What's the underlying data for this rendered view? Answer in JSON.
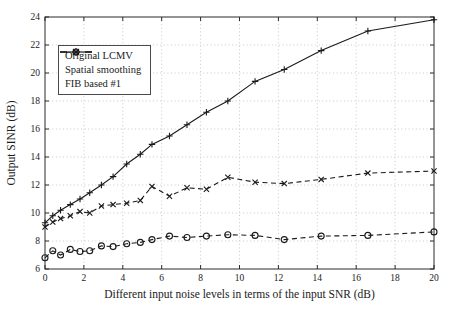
{
  "chart_data": {
    "type": "line",
    "title": "",
    "xlabel": "Different input noise levels in terms of the input SNR (dB)",
    "ylabel": "Output SINR (dB)",
    "xlim": [
      0,
      20
    ],
    "ylim": [
      6,
      24
    ],
    "xticks": [
      0,
      2,
      4,
      6,
      8,
      10,
      12,
      14,
      16,
      18,
      20
    ],
    "yticks": [
      6,
      8,
      10,
      12,
      14,
      16,
      18,
      20,
      22,
      24
    ],
    "grid": "dotted",
    "legend_position": "top-left",
    "line_color": "#1a1a1a",
    "grid_color": "#c8c8c8",
    "x": [
      0,
      0.4,
      0.8,
      1.3,
      1.8,
      2.3,
      2.9,
      3.5,
      4.2,
      4.9,
      5.5,
      6.4,
      7.3,
      8.3,
      9.4,
      10.8,
      12.3,
      14.2,
      16.6,
      20
    ],
    "series": [
      {
        "name": "Original LCMV",
        "line": "dashed",
        "marker": "circle",
        "values": [
          6.8,
          7.3,
          7.0,
          7.4,
          7.25,
          7.3,
          7.65,
          7.6,
          7.8,
          7.9,
          8.1,
          8.35,
          8.25,
          8.35,
          8.45,
          8.4,
          8.1,
          8.35,
          8.4,
          8.65
        ]
      },
      {
        "name": "Spatial smoothing",
        "line": "dashed",
        "marker": "x",
        "values": [
          9.0,
          9.35,
          9.6,
          9.8,
          10.1,
          10.0,
          10.5,
          10.6,
          10.7,
          10.9,
          11.9,
          11.2,
          11.8,
          11.7,
          12.55,
          12.2,
          12.1,
          12.4,
          12.85,
          13.0
        ]
      },
      {
        "name": "FIB based #1",
        "line": "solid",
        "marker": "plus",
        "values": [
          9.3,
          9.8,
          10.2,
          10.6,
          11.0,
          11.45,
          12.0,
          12.6,
          13.5,
          14.2,
          14.9,
          15.5,
          16.3,
          17.2,
          18.0,
          19.4,
          20.25,
          21.6,
          23.0,
          23.8
        ]
      }
    ]
  }
}
